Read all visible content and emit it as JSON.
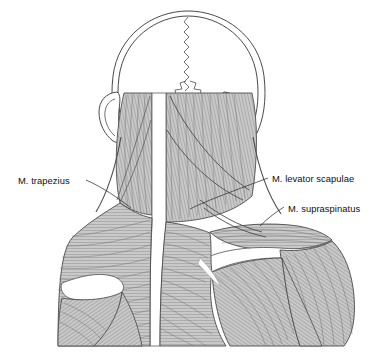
{
  "figure": {
    "view": "posterior",
    "background_color": "#ffffff",
    "line_color": "#3c3c3c",
    "muscle_fill": "#c6c6c6",
    "muscle_fiber_color": "#6b6b6b",
    "bone_fill": "#ffffff",
    "label_color": "#100f0d"
  },
  "labels": {
    "trapezius": "M. trapezius",
    "levator_scapulae": "M. levator scapulae",
    "supraspinatus": "M. supraspinatus"
  },
  "structures": {
    "skull": "cranium-outline",
    "sutures": "sagittal-and-lambdoid-suture",
    "ear_left": "auricle-left",
    "ear_right": "auricle-right",
    "midline": "nuchal-ligament-midline",
    "scapular_spine_left": "spine-of-scapula-left",
    "scapular_spine_right": "spine-of-scapula-right",
    "acromion": "acromion-process",
    "deltoid": "deltoid-muscle",
    "infraspinatus": "infraspinatus-muscle"
  }
}
